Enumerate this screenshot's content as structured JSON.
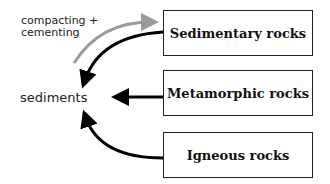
{
  "diagram": {
    "boxes": [
      {
        "id": "sedimentary",
        "label": "Sedimentary rocks"
      },
      {
        "id": "metamorphic",
        "label": "Metamorphic rocks"
      },
      {
        "id": "igneous",
        "label": "Igneous rocks"
      }
    ],
    "labels": {
      "process_line1": "compacting +",
      "process_line2": "cementing",
      "sediments": "sediments"
    },
    "arrows": [
      {
        "from": "sedimentary",
        "to": "sediments",
        "color": "#000000"
      },
      {
        "from": "metamorphic",
        "to": "sediments",
        "color": "#000000"
      },
      {
        "from": "igneous",
        "to": "sediments",
        "color": "#000000"
      },
      {
        "from": "sediments",
        "to": "sedimentary",
        "color": "#9a9a9a",
        "label": "compacting + cementing"
      }
    ],
    "colors": {
      "arrow": "#000000",
      "process_arrow": "#9a9a9a",
      "border": "#222222"
    }
  }
}
